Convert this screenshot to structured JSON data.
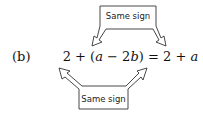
{
  "part_label": "(b)",
  "equation": {
    "lhs": [
      {
        "text": "2",
        "italic": false
      },
      {
        "text": " + (",
        "italic": false
      },
      {
        "text": "a",
        "italic": true
      },
      {
        "text": " − 2",
        "italic": false
      },
      {
        "text": "b",
        "italic": true
      },
      {
        "text": ")",
        "italic": false
      }
    ],
    "equals": " = ",
    "rhs": [
      {
        "text": "2",
        "italic": false
      },
      {
        "text": " + ",
        "italic": false
      },
      {
        "text": "a",
        "italic": true
      },
      {
        "text": " − 2",
        "italic": false
      },
      {
        "text": "b",
        "italic": true
      }
    ]
  },
  "callouts": {
    "top": {
      "label": "Same sign"
    },
    "bottom": {
      "label": "Same sign"
    }
  }
}
